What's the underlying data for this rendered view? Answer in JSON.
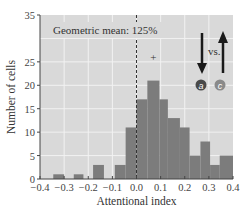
{
  "chart_data": {
    "type": "bar",
    "subtype": "histogram",
    "title": "",
    "xlabel": "Attentional index",
    "ylabel": "Number of cells",
    "xlim": [
      -0.4,
      0.4
    ],
    "ylim": [
      0,
      35
    ],
    "x_ticks": [
      "-0.4",
      "-0.3",
      "-0.2",
      "-0.1",
      "0.0",
      "0.1",
      "0.2",
      "0.3",
      "0.4"
    ],
    "x_tick_values": [
      -0.4,
      -0.3,
      -0.2,
      -0.1,
      0.0,
      0.1,
      0.2,
      0.3,
      0.4
    ],
    "y_ticks": [
      "0",
      "5",
      "10",
      "15",
      "20",
      "25",
      "35"
    ],
    "y_tick_values": [
      0,
      5,
      10,
      15,
      20,
      25,
      35
    ],
    "grid": true,
    "bins": [
      {
        "start": -0.345,
        "end": -0.3,
        "count": 1
      },
      {
        "start": -0.26,
        "end": -0.22,
        "count": 1
      },
      {
        "start": -0.18,
        "end": -0.135,
        "count": 3
      },
      {
        "start": -0.09,
        "end": -0.045,
        "count": 3
      },
      {
        "start": -0.045,
        "end": 0.0,
        "count": 11
      },
      {
        "start": 0.0,
        "end": 0.045,
        "count": 17
      },
      {
        "start": 0.045,
        "end": 0.095,
        "count": 21
      },
      {
        "start": 0.095,
        "end": 0.13,
        "count": 17
      },
      {
        "start": 0.13,
        "end": 0.18,
        "count": 13
      },
      {
        "start": 0.18,
        "end": 0.22,
        "count": 11
      },
      {
        "start": 0.22,
        "end": 0.265,
        "count": 5
      },
      {
        "start": 0.265,
        "end": 0.305,
        "count": 8
      },
      {
        "start": 0.305,
        "end": 0.345,
        "count": 3
      },
      {
        "start": 0.345,
        "end": 0.4,
        "count": 5
      }
    ],
    "reference_line": {
      "x": 0.0,
      "style": "dashed"
    },
    "annotations": {
      "geometric_mean": "Geometric mean: 125%",
      "peak_marker": "+",
      "peak_marker_x": 0.07,
      "vs_label": "vs.",
      "badge_a": "a",
      "badge_c": "c"
    },
    "colors": {
      "plot_background": "#d9d9d9",
      "bar": "#7c7c7c",
      "grid": "#f2f2f2",
      "badge_a": "#4a4a4a",
      "badge_c": "#8a8a8a",
      "arrow": "#1a1a1a"
    }
  }
}
